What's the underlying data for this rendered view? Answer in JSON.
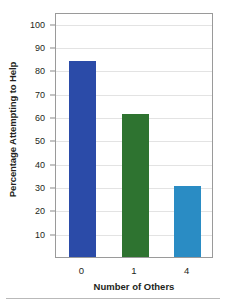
{
  "figure": {
    "top_faint_text": "",
    "bottom_rule": true
  },
  "chart_data": {
    "type": "bar",
    "title": "",
    "xlabel": "Number of Others",
    "ylabel": "Percentage Attempting to Help",
    "categories": [
      "0",
      "1",
      "4"
    ],
    "values": [
      84,
      61.5,
      30.5
    ],
    "series": [
      {
        "name": "Percentage Attempting to Help",
        "values": [
          84,
          61.5,
          30.5
        ]
      }
    ],
    "bar_colors": [
      "#2b4ba8",
      "#2e7330",
      "#2a8cc4"
    ],
    "ylim": [
      0,
      105
    ],
    "yticks": [
      10,
      20,
      30,
      40,
      50,
      60,
      70,
      80,
      90,
      100
    ],
    "ytick_labels": [
      "10",
      "20",
      "30",
      "40",
      "50",
      "60",
      "70",
      "80",
      "90",
      "100"
    ],
    "grid": true,
    "grid_axis": "y",
    "legend": false,
    "legend_position": "none",
    "frame": true
  }
}
